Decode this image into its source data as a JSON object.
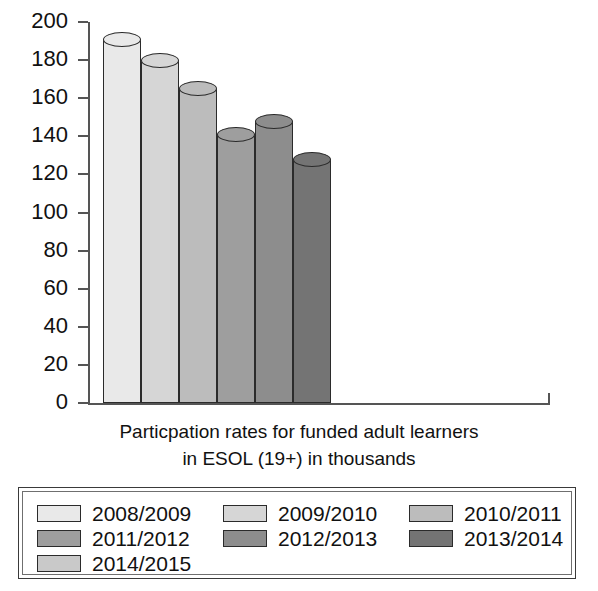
{
  "chart_data": {
    "type": "bar",
    "title": "",
    "caption_line1": "Particpation rates for funded adult learners",
    "caption_line2": "in ESOL (19+) in thousands",
    "xlabel": "",
    "ylabel": "",
    "ylim": [
      0,
      200
    ],
    "ytick_labels": [
      "200",
      "180",
      "160",
      "140",
      "120",
      "100",
      "80",
      "60",
      "40",
      "20",
      "0"
    ],
    "ytick_values": [
      200,
      180,
      160,
      140,
      120,
      100,
      80,
      60,
      40,
      20,
      0
    ],
    "grid": false,
    "legend_position": "below-plot",
    "categories": [
      "2008/2009",
      "2009/2010",
      "2010/2011",
      "2011/2012",
      "2012/2013",
      "2013/2014",
      "2014/2015"
    ],
    "values": [
      191,
      180,
      165,
      141,
      148,
      128,
      null
    ],
    "bar_colors": [
      "#e9e9e9",
      "#d6d6d6",
      "#bcbcbc",
      "#9e9e9e",
      "#8d8d8d",
      "#747474",
      "#c9c9c9"
    ],
    "series": [
      {
        "name": "Particpation rates for funded adult learners in ESOL (19+) in thousands",
        "points": [
          {
            "category": "2008/2009",
            "value": 191,
            "color": "#e9e9e9"
          },
          {
            "category": "2009/2010",
            "value": 180,
            "color": "#d6d6d6"
          },
          {
            "category": "2010/2011",
            "value": 165,
            "color": "#bcbcbc"
          },
          {
            "category": "2011/2012",
            "value": 141,
            "color": "#9e9e9e"
          },
          {
            "category": "2012/2013",
            "value": 148,
            "color": "#8d8d8d"
          },
          {
            "category": "2013/2014",
            "value": 128,
            "color": "#747474"
          }
        ]
      }
    ],
    "legend_entries": [
      {
        "label": "2008/2009",
        "color": "#e9e9e9"
      },
      {
        "label": "2009/2010",
        "color": "#d6d6d6"
      },
      {
        "label": "2010/2011",
        "color": "#bcbcbc"
      },
      {
        "label": "2011/2012",
        "color": "#9e9e9e"
      },
      {
        "label": "2012/2013",
        "color": "#8d8d8d"
      },
      {
        "label": "2013/2014",
        "color": "#747474"
      },
      {
        "label": "2014/2015",
        "color": "#c9c9c9"
      }
    ]
  }
}
